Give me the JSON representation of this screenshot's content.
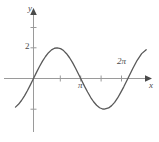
{
  "figure": {
    "background_color": "#ffffff",
    "axis_color": "#9a9a9a",
    "curve_color": "#595959",
    "text_color": "#4a4a4a"
  },
  "axes": {
    "y_axis_label": "y",
    "x_axis_label": "x",
    "y_tick_labels": [
      "2"
    ],
    "x_tick_labels": [
      "π",
      "2π"
    ]
  },
  "chart_data": {
    "type": "line",
    "title": "",
    "xlabel": "x",
    "ylabel": "y",
    "grid": false,
    "legend": null,
    "xlim": [
      -1.2,
      7.6
    ],
    "ylim": [
      -3.2,
      4.6
    ],
    "x_ticks": [
      1.5708,
      3.1416,
      4.7124,
      6.2832
    ],
    "x_tick_labels": [
      "",
      "π",
      "",
      "2π"
    ],
    "y_ticks": [
      2,
      4
    ],
    "y_tick_labels": [
      "2",
      ""
    ],
    "series": [
      {
        "name": "y = 2 sin(x)",
        "equation": "y = 2*sin(x)",
        "amplitude": 2,
        "period": 6.2832,
        "x": [
          -1.2,
          -1.0,
          -0.8,
          -0.6,
          -0.4,
          -0.2,
          0.0,
          0.2,
          0.4,
          0.6,
          0.8,
          1.0,
          1.2,
          1.4,
          1.5708,
          1.8,
          2.0,
          2.2,
          2.4,
          2.6,
          2.8,
          3.0,
          3.1416,
          3.4,
          3.6,
          3.8,
          4.0,
          4.2,
          4.4,
          4.6,
          4.7124,
          5.0,
          5.2,
          5.4,
          5.6,
          5.8,
          6.0,
          6.2832,
          6.6,
          6.9,
          7.2,
          7.5
        ],
        "y": [
          -1.864,
          -1.683,
          -1.434,
          -1.129,
          -0.779,
          -0.397,
          0.0,
          0.397,
          0.779,
          1.129,
          1.434,
          1.683,
          1.864,
          1.971,
          2.0,
          1.947,
          1.819,
          1.617,
          1.351,
          1.031,
          0.67,
          0.282,
          0.0,
          -0.513,
          -0.883,
          -1.223,
          -1.514,
          -1.744,
          -1.907,
          -1.987,
          -2.0,
          -1.918,
          -1.767,
          -1.556,
          -1.27,
          -0.92,
          -0.559,
          0.0,
          0.634,
          1.186,
          1.62,
          1.879
        ]
      }
    ]
  }
}
